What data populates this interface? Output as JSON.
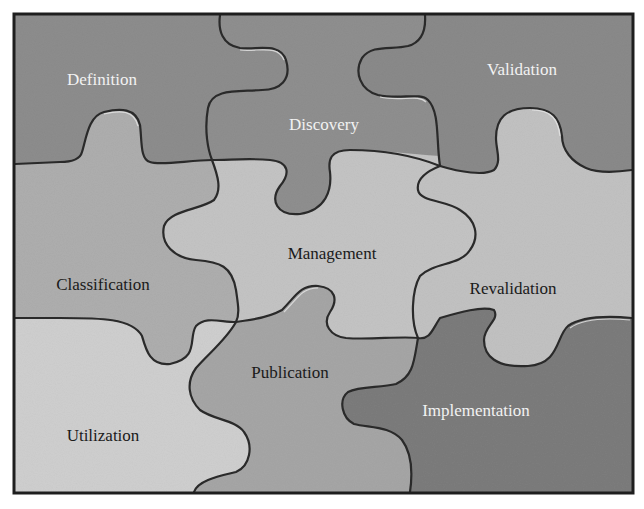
{
  "diagram": {
    "type": "jigsaw-puzzle",
    "pieces": [
      {
        "id": "definition",
        "label": "Definition",
        "shade": "dark",
        "fill": "#8d8d8d",
        "text_color": "#f2f2f2"
      },
      {
        "id": "discovery",
        "label": "Discovery",
        "shade": "dark",
        "fill": "#8f8f8f",
        "text_color": "#f2f2f2"
      },
      {
        "id": "validation",
        "label": "Validation",
        "shade": "dark",
        "fill": "#8a8a8a",
        "text_color": "#f2f2f2"
      },
      {
        "id": "classification",
        "label": "Classification",
        "shade": "medium",
        "fill": "#aeaeae",
        "text_color": "#1a1a1a"
      },
      {
        "id": "management",
        "label": "Management",
        "shade": "light",
        "fill": "#c4c4c4",
        "text_color": "#1a1a1a"
      },
      {
        "id": "revalidation",
        "label": "Revalidation",
        "shade": "light",
        "fill": "#c2c2c2",
        "text_color": "#1a1a1a"
      },
      {
        "id": "utilization",
        "label": "Utilization",
        "shade": "lightest",
        "fill": "#cfcfcf",
        "text_color": "#1a1a1a"
      },
      {
        "id": "publication",
        "label": "Publication",
        "shade": "medium",
        "fill": "#a6a6a6",
        "text_color": "#1a1a1a"
      },
      {
        "id": "implementation",
        "label": "Implementation",
        "shade": "darkest",
        "fill": "#7c7c7c",
        "text_color": "#f2f2f2"
      }
    ],
    "frame_color": "#1e1e1e"
  }
}
